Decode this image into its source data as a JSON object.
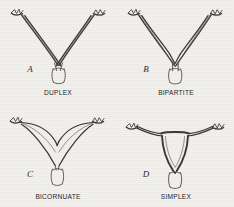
{
  "figure": {
    "background_color": "#f2f1ee",
    "ink_color": "#3a3734",
    "panels": [
      {
        "letter": "A",
        "caption": "DUPLEX",
        "letter_x": 30,
        "letter_y": 72,
        "caption_x": 58,
        "caption_y": 95
      },
      {
        "letter": "B",
        "caption": "BIPARTITE",
        "letter_x": 146,
        "letter_y": 72,
        "caption_x": 176,
        "caption_y": 95
      },
      {
        "letter": "C",
        "caption": "BICORNUATE",
        "letter_x": 30,
        "letter_y": 177,
        "caption_x": 58,
        "caption_y": 199
      },
      {
        "letter": "D",
        "caption": "SIMPLEX",
        "letter_x": 146,
        "letter_y": 177,
        "caption_x": 176,
        "caption_y": 199
      }
    ]
  }
}
